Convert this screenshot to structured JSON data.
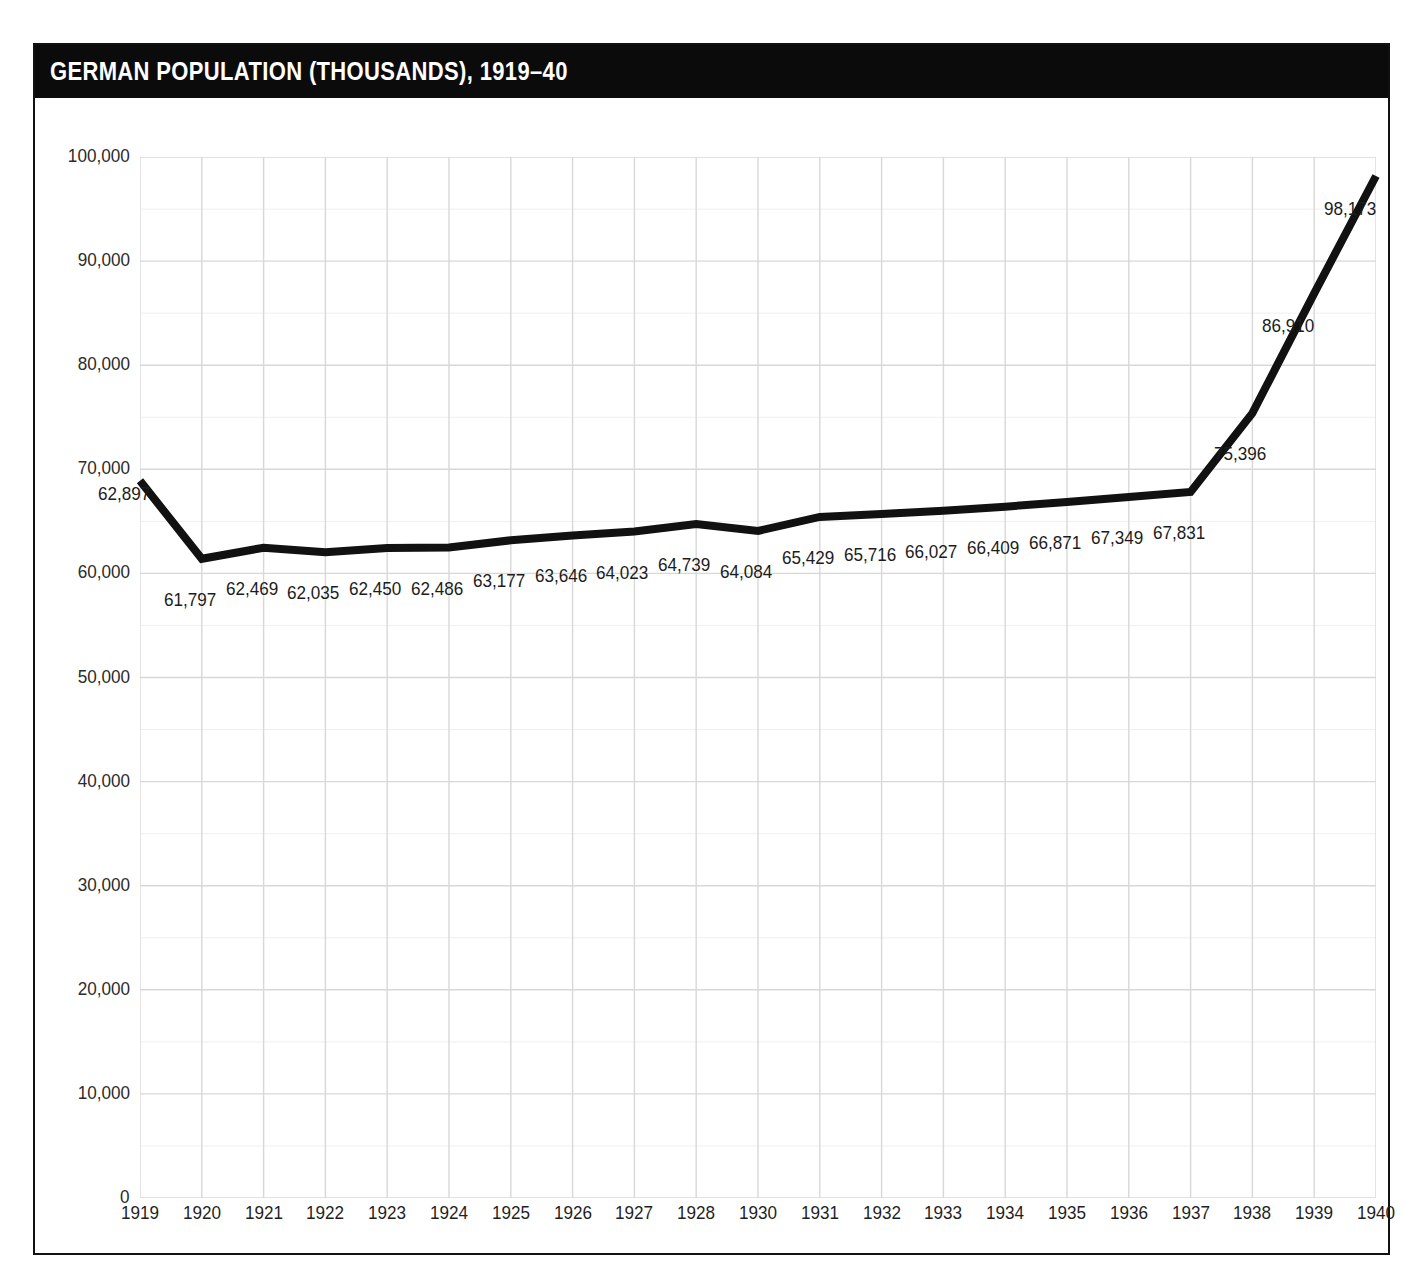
{
  "header": {
    "title": "GERMAN POPULATION (THOUSANDS), 1919–40",
    "bar_color": "#0b0b0b",
    "text_color": "#ffffff"
  },
  "frame": {
    "border_color": "#111111",
    "background": "#ffffff"
  },
  "chart_data": {
    "type": "line",
    "title": "GERMAN POPULATION (THOUSANDS), 1919–40",
    "subtitle": "",
    "xlabel": "",
    "ylabel": "",
    "categories": [
      "1919",
      "1920",
      "1921",
      "1922",
      "1923",
      "1924",
      "1925",
      "1926",
      "1927",
      "1928",
      "1930",
      "1931",
      "1932",
      "1933",
      "1934",
      "1935",
      "1936",
      "1937",
      "1938",
      "1939",
      "1940"
    ],
    "values": [
      62897,
      61797,
      62469,
      62035,
      62450,
      62486,
      63177,
      63646,
      64023,
      64739,
      64084,
      65429,
      65716,
      66027,
      66409,
      66871,
      67349,
      67831,
      75396,
      86910,
      98173
    ],
    "plotted_values": [
      68900,
      61400,
      62469,
      62035,
      62450,
      62486,
      63177,
      63646,
      64023,
      64739,
      64084,
      65429,
      65716,
      66027,
      66409,
      66871,
      67349,
      67831,
      75396,
      86910,
      98173
    ],
    "data_labels": [
      "62,897",
      "61,797",
      "62,469",
      "62,035",
      "62,450",
      "62,486",
      "63,177",
      "63,646",
      "64,023",
      "64,739",
      "64,084",
      "65,429",
      "65,716",
      "66,027",
      "66,409",
      "66,871",
      "67,349",
      "67,831",
      "75,396",
      "86,910",
      "98,173"
    ],
    "label_side": [
      "above",
      "below",
      "below",
      "below",
      "below",
      "below",
      "below",
      "below",
      "below",
      "below",
      "below",
      "below",
      "below",
      "below",
      "below",
      "below",
      "below",
      "below",
      "below",
      "right",
      "right"
    ],
    "ylim": [
      0,
      100000
    ],
    "ytick_values": [
      0,
      10000,
      20000,
      30000,
      40000,
      50000,
      60000,
      70000,
      80000,
      90000,
      100000
    ],
    "ytick_labels": [
      "0",
      "10,000",
      "20,000",
      "30,000",
      "40,000",
      "50,000",
      "60,000",
      "70,000",
      "80,000",
      "90,000",
      "100,000"
    ],
    "minor_ytick_values": [
      5000,
      15000,
      25000,
      35000,
      45000,
      55000,
      65000,
      75000,
      85000,
      95000
    ],
    "grid": true,
    "grid_major_color": "#d8d8d8",
    "grid_minor_color": "#efefef",
    "legend": "none",
    "series": [
      {
        "name": "German population (thousands)",
        "color": "#111111",
        "line_width": 8,
        "markers": false
      }
    ]
  }
}
